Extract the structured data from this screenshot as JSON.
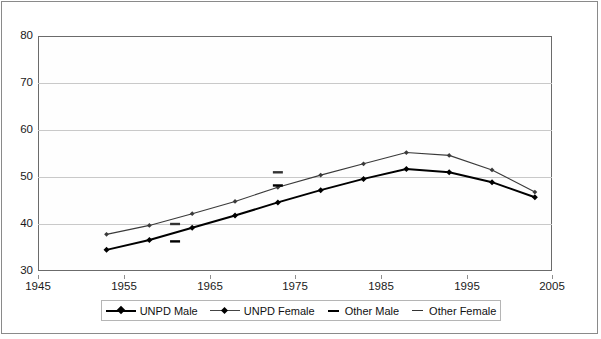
{
  "chart_data": {
    "type": "line",
    "title": "",
    "xlabel": "",
    "ylabel": "",
    "xlim": [
      1945,
      2005
    ],
    "ylim": [
      30,
      80
    ],
    "xticks": [
      1945,
      1955,
      1965,
      1975,
      1985,
      1995,
      2005
    ],
    "yticks": [
      30,
      40,
      50,
      60,
      70,
      80
    ],
    "grid": "horizontal",
    "legend_position": "bottom",
    "series": [
      {
        "name": "UNPD Male",
        "style": "line-marker",
        "color": "#000000",
        "linewidth": "thick",
        "x": [
          1953,
          1958,
          1963,
          1968,
          1973,
          1978,
          1983,
          1988,
          1993,
          1998,
          2003
        ],
        "values": [
          34.5,
          36.6,
          39.2,
          41.8,
          44.6,
          47.2,
          49.6,
          51.7,
          51.0,
          48.9,
          45.7
        ]
      },
      {
        "name": "UNPD Female",
        "style": "line-marker",
        "color": "#3a3a3a",
        "linewidth": "thin",
        "x": [
          1953,
          1958,
          1963,
          1968,
          1973,
          1978,
          1983,
          1988,
          1993,
          1998,
          2003
        ],
        "values": [
          37.8,
          39.7,
          42.2,
          44.8,
          47.8,
          50.4,
          52.8,
          55.2,
          54.6,
          51.5,
          46.8
        ]
      },
      {
        "name": "Other Male",
        "style": "dash-marker",
        "color": "#000000",
        "x": [
          1961,
          1973
        ],
        "values": [
          36.3,
          48.2
        ]
      },
      {
        "name": "Other Female",
        "style": "dash-marker",
        "color": "#333333",
        "x": [
          1961,
          1973
        ],
        "values": [
          40.0,
          51.0
        ]
      }
    ]
  },
  "axes": {
    "y_ticks": [
      {
        "label": "80",
        "value": 80
      },
      {
        "label": "70",
        "value": 70
      },
      {
        "label": "60",
        "value": 60
      },
      {
        "label": "50",
        "value": 50
      },
      {
        "label": "40",
        "value": 40
      },
      {
        "label": "30",
        "value": 30
      }
    ],
    "x_ticks": [
      {
        "label": "1945",
        "value": 1945
      },
      {
        "label": "1955",
        "value": 1955
      },
      {
        "label": "1965",
        "value": 1965
      },
      {
        "label": "1975",
        "value": 1975
      },
      {
        "label": "1985",
        "value": 1985
      },
      {
        "label": "1995",
        "value": 1995
      },
      {
        "label": "2005",
        "value": 2005
      }
    ]
  },
  "legend": {
    "items": [
      {
        "label": "UNPD Male",
        "key": "solid-diamond-thick"
      },
      {
        "label": "UNPD Female",
        "key": "solid-diamond-thin"
      },
      {
        "label": "Other Male",
        "key": "dash-thick"
      },
      {
        "label": "Other Female",
        "key": "dash-thin"
      }
    ]
  },
  "colors": {
    "frame": "#8a8a8a",
    "plot_border": "#6b6b6b",
    "gridline": "#c9c9c9",
    "series_primary": "#000000",
    "series_secondary": "#3a3a3a",
    "background": "#ffffff"
  }
}
